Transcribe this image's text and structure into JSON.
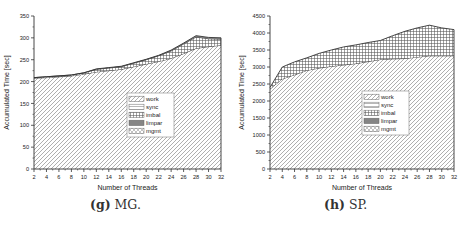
{
  "chart_data": [
    {
      "type": "area",
      "stacked": true,
      "panel_id": "mg",
      "caption_label": "(g)",
      "caption_text": "MG.",
      "title": "",
      "xlabel": "Number of Threads",
      "ylabel": "Accumulated Time [sec]",
      "xlim": [
        2,
        32
      ],
      "ylim": [
        0,
        350
      ],
      "xticks": [
        2,
        4,
        6,
        8,
        10,
        12,
        14,
        16,
        18,
        20,
        22,
        24,
        26,
        28,
        30,
        32
      ],
      "yticks": [
        0,
        50,
        100,
        150,
        200,
        250,
        300,
        350
      ],
      "x": [
        2,
        4,
        6,
        8,
        10,
        12,
        14,
        16,
        18,
        20,
        22,
        24,
        26,
        28,
        30,
        32
      ],
      "series": [
        {
          "name": "work",
          "values": [
            208,
            209,
            211,
            213,
            217,
            222,
            225,
            228,
            234,
            240,
            246,
            253,
            264,
            276,
            280,
            283
          ]
        },
        {
          "name": "sync",
          "values": [
            0,
            0,
            0,
            0,
            0,
            0,
            0,
            0,
            0,
            0,
            0,
            0,
            0,
            0,
            0,
            0
          ]
        },
        {
          "name": "imbal",
          "values": [
            1,
            2,
            2,
            2,
            3,
            6,
            6,
            6,
            8,
            10,
            13,
            17,
            22,
            26,
            18,
            14
          ]
        },
        {
          "name": "limpar",
          "values": [
            0,
            0,
            0,
            0,
            0,
            1,
            1,
            1,
            1,
            1,
            1,
            2,
            2,
            3,
            3,
            3
          ]
        },
        {
          "name": "mgmt",
          "values": [
            0,
            0,
            0,
            0,
            0,
            0,
            0,
            0,
            0,
            0,
            0,
            0,
            0,
            0,
            0,
            0
          ]
        }
      ],
      "legend": [
        "work",
        "sync",
        "imbal",
        "limpar",
        "mgmt"
      ],
      "legend_position": "center-bottom inside plot",
      "grid": false
    },
    {
      "type": "area",
      "stacked": true,
      "panel_id": "sp",
      "caption_label": "(h)",
      "caption_text": "SP.",
      "title": "",
      "xlabel": "Number of Threads",
      "ylabel": "Accumulated Time [sec]",
      "xlim": [
        2,
        32
      ],
      "ylim": [
        0,
        4500
      ],
      "xticks": [
        2,
        4,
        6,
        8,
        10,
        12,
        14,
        16,
        18,
        20,
        22,
        24,
        26,
        28,
        30,
        32
      ],
      "yticks": [
        0,
        500,
        1000,
        1500,
        2000,
        2500,
        3000,
        3500,
        4000,
        4500
      ],
      "x": [
        2,
        4,
        6,
        8,
        10,
        12,
        14,
        16,
        18,
        20,
        22,
        24,
        26,
        28,
        30,
        32
      ],
      "series": [
        {
          "name": "work",
          "values": [
            2350,
            2650,
            2770,
            2900,
            2970,
            3020,
            3060,
            3100,
            3160,
            3220,
            3240,
            3250,
            3290,
            3330,
            3330,
            3330
          ]
        },
        {
          "name": "sync",
          "values": [
            0,
            0,
            0,
            0,
            0,
            0,
            0,
            0,
            0,
            0,
            0,
            0,
            0,
            0,
            0,
            0
          ]
        },
        {
          "name": "imbal",
          "values": [
            50,
            350,
            380,
            370,
            430,
            480,
            530,
            550,
            560,
            560,
            680,
            800,
            860,
            900,
            820,
            770
          ]
        },
        {
          "name": "limpar",
          "values": [
            0,
            0,
            0,
            0,
            0,
            0,
            0,
            0,
            0,
            0,
            0,
            0,
            0,
            0,
            0,
            0
          ]
        },
        {
          "name": "mgmt",
          "values": [
            0,
            0,
            0,
            0,
            0,
            0,
            0,
            0,
            0,
            0,
            0,
            0,
            0,
            0,
            0,
            0
          ]
        }
      ],
      "legend": [
        "work",
        "sync",
        "imbal",
        "limpar",
        "mgmt"
      ],
      "legend_position": "center-bottom inside plot",
      "grid": false
    }
  ],
  "layout": {
    "mg": {
      "plot": {
        "x0": 34,
        "x1": 221,
        "y0": 169,
        "y1": 16
      },
      "legend": {
        "x": 127,
        "y": 93,
        "w": 47,
        "h": 44
      },
      "caption": {
        "x": 90,
        "y": 197
      },
      "ylabel_x": 9,
      "xlabel_y": 190
    },
    "sp": {
      "plot": {
        "x0": 35,
        "x1": 219,
        "y0": 169,
        "y1": 16
      },
      "legend": {
        "x": 127,
        "y": 91,
        "w": 47,
        "h": 44
      },
      "caption": {
        "x": 89,
        "y": 197
      },
      "ylabel_x": 9,
      "xlabel_y": 190
    }
  },
  "colors": {
    "axis": "#333333",
    "line": "#333333",
    "hatch": "#9a9a9a",
    "grid_hatch": "#555555",
    "limpar_fill": "#8c8c8c",
    "text": "#222222"
  }
}
